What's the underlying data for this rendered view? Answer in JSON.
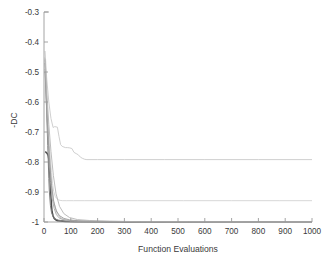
{
  "chart_data": {
    "type": "line",
    "title": "",
    "subtitle": "",
    "xlabel": "Function Evaluations",
    "ylabel": "-DC",
    "xlim": [
      0,
      1000
    ],
    "ylim": [
      -1.0,
      -0.3
    ],
    "grid": false,
    "legend": "none",
    "legend_position": "none",
    "xticks": [
      0,
      100,
      200,
      300,
      400,
      500,
      600,
      700,
      800,
      900,
      1000
    ],
    "xtick_labels": [
      "0",
      "100",
      "200",
      "300",
      "400",
      "500",
      "600",
      "700",
      "800",
      "900",
      "1000"
    ],
    "yticks": [
      -0.3,
      -0.4,
      -0.5,
      -0.6,
      -0.7,
      -0.8,
      -0.9,
      -1.0
    ],
    "ytick_labels": [
      "-0.3",
      "-0.4",
      "-0.5",
      "-0.6",
      "-0.7",
      "-0.8",
      "-0.9",
      "-1"
    ],
    "annotations": [],
    "series": [
      {
        "name": "run-converged-dark",
        "color": "#4a4a4a",
        "width": 1.5,
        "x": [
          5,
          8,
          10,
          12,
          14,
          16,
          18,
          20,
          22,
          24,
          26,
          28,
          30,
          34,
          38,
          44,
          50,
          60,
          80,
          120,
          200,
          320,
          500,
          700,
          850,
          1000
        ],
        "y": [
          -0.765,
          -0.768,
          -0.77,
          -0.772,
          -0.775,
          -0.78,
          -0.79,
          -0.81,
          -0.845,
          -0.88,
          -0.915,
          -0.945,
          -0.965,
          -0.98,
          -0.988,
          -0.993,
          -0.996,
          -0.997,
          -0.998,
          -0.999,
          -0.999,
          -1.0,
          -1.0,
          -1.0,
          -1.0,
          -1.0
        ]
      },
      {
        "name": "run-fast-midgray",
        "color": "#7d7d7d",
        "width": 1.0,
        "x": [
          4,
          6,
          8,
          10,
          12,
          14,
          16,
          18,
          20,
          24,
          28,
          34,
          42,
          55,
          75,
          110,
          180,
          300,
          500,
          750,
          1000
        ],
        "y": [
          -0.47,
          -0.52,
          -0.575,
          -0.63,
          -0.69,
          -0.745,
          -0.8,
          -0.855,
          -0.9,
          -0.945,
          -0.968,
          -0.982,
          -0.99,
          -0.994,
          -0.996,
          -0.998,
          -0.999,
          -0.999,
          -1.0,
          -1.0,
          -1.0
        ]
      },
      {
        "name": "run-stalled-high-plateau",
        "color": "#c9c9c9",
        "width": 0.9,
        "x": [
          4,
          10,
          18,
          26,
          34,
          40,
          45,
          50,
          56,
          62,
          68,
          74,
          80,
          88,
          96,
          104,
          112,
          120,
          128,
          136,
          144,
          152,
          160,
          200,
          300,
          450,
          600,
          800,
          1000
        ],
        "y": [
          -0.43,
          -0.52,
          -0.6,
          -0.655,
          -0.685,
          -0.682,
          -0.683,
          -0.684,
          -0.715,
          -0.742,
          -0.748,
          -0.75,
          -0.752,
          -0.752,
          -0.753,
          -0.755,
          -0.768,
          -0.772,
          -0.776,
          -0.784,
          -0.788,
          -0.791,
          -0.792,
          -0.792,
          -0.792,
          -0.792,
          -0.792,
          -0.792,
          -0.792
        ]
      },
      {
        "name": "run-stalled-mid-plateau",
        "color": "#d2d2d2",
        "width": 0.9,
        "x": [
          4,
          8,
          12,
          16,
          20,
          24,
          28,
          32,
          36,
          42,
          48,
          54,
          60,
          70,
          85,
          110,
          150,
          220,
          350,
          520,
          700,
          880,
          1000
        ],
        "y": [
          -0.45,
          -0.54,
          -0.62,
          -0.69,
          -0.745,
          -0.79,
          -0.835,
          -0.872,
          -0.898,
          -0.915,
          -0.922,
          -0.926,
          -0.928,
          -0.929,
          -0.929,
          -0.929,
          -0.929,
          -0.929,
          -0.929,
          -0.929,
          -0.929,
          -0.929,
          -0.929
        ]
      },
      {
        "name": "run-slow-converged-light",
        "color": "#bdbdbd",
        "width": 0.9,
        "x": [
          4,
          8,
          12,
          16,
          20,
          25,
          30,
          36,
          42,
          50,
          58,
          66,
          76,
          90,
          110,
          140,
          190,
          260,
          380,
          550,
          750,
          1000
        ],
        "y": [
          -0.46,
          -0.55,
          -0.635,
          -0.705,
          -0.77,
          -0.838,
          -0.888,
          -0.928,
          -0.952,
          -0.972,
          -0.982,
          -0.988,
          -0.992,
          -0.995,
          -0.996,
          -0.997,
          -0.998,
          -0.999,
          -0.999,
          -0.999,
          -1.0,
          -1.0
        ]
      },
      {
        "name": "run-converged-gray-a",
        "color": "#a8a8a8",
        "width": 0.9,
        "x": [
          4,
          9,
          14,
          19,
          24,
          30,
          38,
          46,
          56,
          70,
          90,
          130,
          200,
          330,
          520,
          760,
          1000
        ],
        "y": [
          -0.49,
          -0.6,
          -0.7,
          -0.79,
          -0.865,
          -0.92,
          -0.955,
          -0.975,
          -0.986,
          -0.992,
          -0.995,
          -0.997,
          -0.998,
          -0.999,
          -1.0,
          -1.0,
          -1.0
        ]
      },
      {
        "name": "run-converged-gray-b",
        "color": "#9c9c9c",
        "width": 0.9,
        "x": [
          4,
          10,
          16,
          22,
          28,
          36,
          46,
          58,
          74,
          96,
          130,
          190,
          290,
          450,
          680,
          1000
        ],
        "y": [
          -0.5,
          -0.625,
          -0.725,
          -0.81,
          -0.878,
          -0.932,
          -0.963,
          -0.979,
          -0.988,
          -0.993,
          -0.996,
          -0.998,
          -0.999,
          -0.999,
          -1.0,
          -1.0
        ]
      },
      {
        "name": "run-converged-gray-c",
        "color": "#b5b5b5",
        "width": 0.9,
        "x": [
          4,
          11,
          18,
          26,
          35,
          45,
          58,
          74,
          95,
          125,
          170,
          245,
          360,
          540,
          780,
          1000
        ],
        "y": [
          -0.455,
          -0.575,
          -0.675,
          -0.765,
          -0.845,
          -0.906,
          -0.948,
          -0.972,
          -0.985,
          -0.992,
          -0.995,
          -0.997,
          -0.999,
          -0.999,
          -1.0,
          -1.0
        ]
      }
    ]
  },
  "axes": {
    "ylabel_text": "-DC",
    "xlabel_text": "Function Evaluations"
  }
}
